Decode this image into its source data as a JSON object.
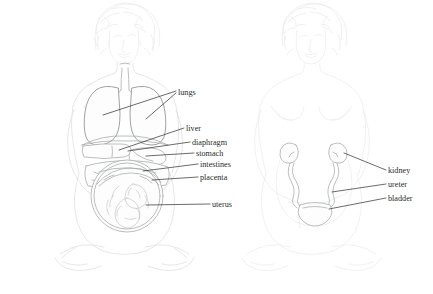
{
  "figure": {
    "background_color": "#ffffff",
    "label_color": "#2b2b2b",
    "leader_color": "#2b2b2b",
    "sketch_color": "#d8dadc",
    "organ_color": "#a6a8aa",
    "width": 433,
    "height": 294
  },
  "left_figure": {
    "name": "pregnant-woman-digestive-respiratory",
    "labels": [
      {
        "id": "lungs",
        "text": "lungs",
        "x": 178,
        "y": 95
      },
      {
        "id": "liver",
        "text": "liver",
        "x": 186,
        "y": 131
      },
      {
        "id": "diaphragm",
        "text": "diaphragm",
        "x": 192,
        "y": 145
      },
      {
        "id": "stomach",
        "text": "stomach",
        "x": 196,
        "y": 156
      },
      {
        "id": "intestines",
        "text": "intestines",
        "x": 200,
        "y": 167
      },
      {
        "id": "placenta",
        "text": "placenta",
        "x": 200,
        "y": 180
      },
      {
        "id": "uterus",
        "text": "uterus",
        "x": 212,
        "y": 207
      }
    ]
  },
  "right_figure": {
    "name": "pregnant-woman-urinary-system",
    "labels": [
      {
        "id": "kidney",
        "text": "kidney",
        "x": 388,
        "y": 173
      },
      {
        "id": "ureter",
        "text": "ureter",
        "x": 388,
        "y": 187
      },
      {
        "id": "bladder",
        "text": "bladder",
        "x": 388,
        "y": 201
      }
    ]
  },
  "organs": {
    "left": [
      "lungs",
      "liver",
      "diaphragm",
      "stomach",
      "intestines",
      "placenta",
      "uterus",
      "trachea",
      "fetus"
    ],
    "right": [
      "kidney",
      "ureter",
      "bladder"
    ]
  }
}
